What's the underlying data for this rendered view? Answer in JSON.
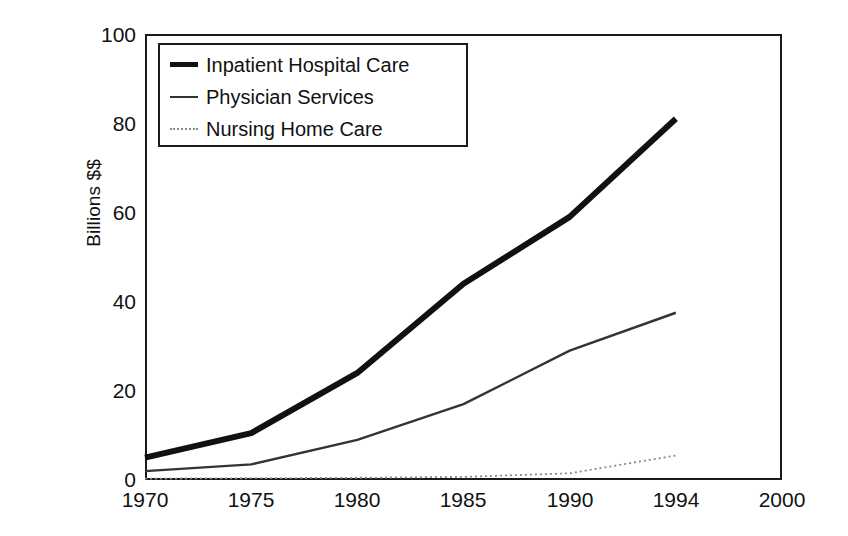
{
  "chart_data": {
    "type": "line",
    "title": "",
    "xlabel": "",
    "ylabel": "Billions $$",
    "ylim": [
      0,
      100
    ],
    "yticks": [
      0,
      20,
      40,
      60,
      80,
      100
    ],
    "categories": [
      "1970",
      "1975",
      "1980",
      "1985",
      "1990",
      "1994",
      "2000"
    ],
    "grid": false,
    "legend_position": "top-left-inside",
    "series": [
      {
        "name": "Inpatient Hospital Care",
        "style": "thick-solid",
        "x": [
          "1970",
          "1975",
          "1980",
          "1985",
          "1990",
          "1994"
        ],
        "values": [
          5,
          10.5,
          24,
          44,
          59,
          81
        ]
      },
      {
        "name": "Physician Services",
        "style": "thin-solid",
        "x": [
          "1970",
          "1975",
          "1980",
          "1985",
          "1990",
          "1994"
        ],
        "values": [
          2,
          3.5,
          9,
          17,
          29,
          37.5
        ]
      },
      {
        "name": "Nursing Home Care",
        "style": "dotted",
        "x": [
          "1970",
          "1975",
          "1980",
          "1985",
          "1990",
          "1994"
        ],
        "values": [
          0.3,
          0.4,
          0.5,
          0.7,
          1.5,
          5.5
        ]
      }
    ]
  },
  "axes": {
    "y_title": "Billions $$",
    "y_tick_labels": [
      "100",
      "80",
      "60",
      "40",
      "20",
      "0"
    ],
    "x_tick_labels": [
      "1970",
      "1975",
      "1980",
      "1985",
      "1990",
      "1994",
      "2000"
    ]
  },
  "legend": {
    "items": [
      {
        "label": "Inpatient Hospital Care",
        "swatch": "thick-line-swatch"
      },
      {
        "label": "Physician Services",
        "swatch": "thin-line-swatch"
      },
      {
        "label": "Nursing Home Care",
        "swatch": "dotted-line-swatch"
      }
    ]
  },
  "colors": {
    "line_dark": "#111111",
    "line_mid": "#333333",
    "line_light": "#8a8a8a",
    "frame": "#1a1a1a",
    "background": "#ffffff"
  }
}
